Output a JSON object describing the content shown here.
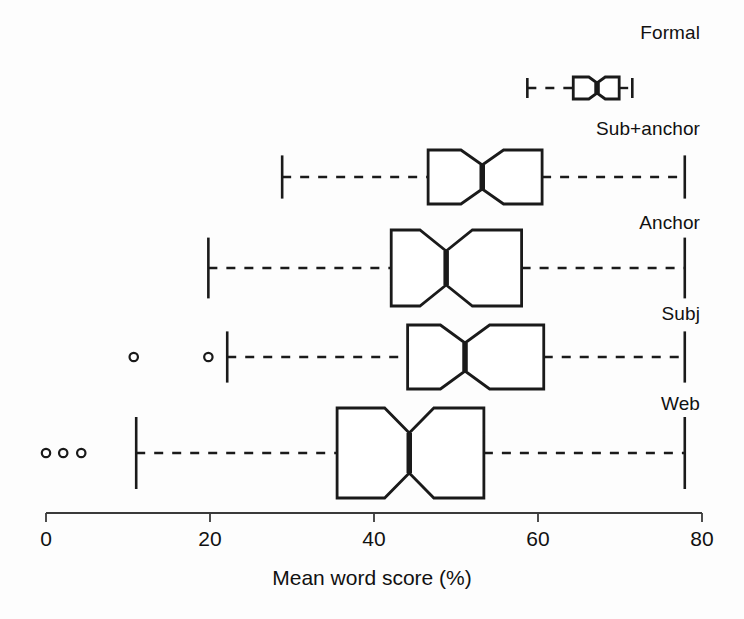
{
  "chart_data": {
    "type": "box",
    "title": "",
    "xlabel": "Mean word score (%)",
    "ylabel": "",
    "xlim": [
      0,
      80
    ],
    "xticks": [
      0,
      20,
      40,
      60,
      80
    ],
    "xtick_labels": [
      "0",
      "20",
      "40",
      "60",
      "80"
    ],
    "grid": false,
    "legend": "none",
    "orientation": "horizontal",
    "notched": true,
    "categories": [
      "Formal",
      "Sub+anchor",
      "Anchor",
      "Subj",
      "Web"
    ],
    "boxes": [
      {
        "label": "Formal",
        "whisker_low": 58.7,
        "q1": 64.3,
        "median": 67.2,
        "q3": 69.9,
        "whisker_high": 71.5,
        "notch_low": 66.2,
        "notch_high": 68.2,
        "outliers": []
      },
      {
        "label": "Sub+anchor",
        "whisker_low": 28.8,
        "q1": 46.6,
        "median": 53.2,
        "q3": 60.5,
        "whisker_high": 77.9,
        "notch_low": 50.6,
        "notch_high": 55.8,
        "outliers": []
      },
      {
        "label": "Anchor",
        "whisker_low": 19.8,
        "q1": 42.1,
        "median": 48.8,
        "q3": 58.0,
        "whisker_high": 77.9,
        "notch_low": 45.6,
        "notch_high": 52.0,
        "outliers": []
      },
      {
        "label": "Subj",
        "whisker_low": 22.1,
        "q1": 44.1,
        "median": 51.1,
        "q3": 60.7,
        "whisker_high": 77.9,
        "notch_low": 48.1,
        "notch_high": 54.1,
        "outliers": [
          10.7,
          19.8
        ]
      },
      {
        "label": "Web",
        "whisker_low": 11.0,
        "q1": 35.5,
        "median": 44.3,
        "q3": 53.4,
        "whisker_high": 77.9,
        "notch_low": 41.3,
        "notch_high": 47.3,
        "outliers": [
          0.0,
          2.1,
          4.3
        ]
      }
    ],
    "colors": {
      "line": "#1a1a1a",
      "background": "#fdfdfd",
      "axis": "#3a3a3a"
    }
  },
  "axis": {
    "title": "Mean word score (%)",
    "ticks": [
      {
        "value": 0,
        "label": "0"
      },
      {
        "value": 20,
        "label": "20"
      },
      {
        "value": 40,
        "label": "40"
      },
      {
        "value": 60,
        "label": "60"
      },
      {
        "value": 80,
        "label": "80"
      }
    ]
  },
  "labels": {
    "formal": "Formal",
    "sub_anchor": "Sub+anchor",
    "anchor": "Anchor",
    "subj": "Subj",
    "web": "Web"
  }
}
